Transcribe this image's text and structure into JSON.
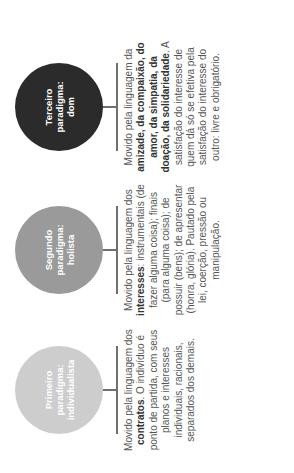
{
  "diagram": {
    "colors": {
      "first": "#cdcdcd",
      "second": "#9a9a9a",
      "third": "#2b2b2b",
      "connector": "#6f6f6f",
      "text": "#555555"
    },
    "paradigms": [
      {
        "title": "Primeiro paradigma: individualista",
        "text_before": "Movido pela linguagem dos ",
        "bold": "contratos",
        "text_after": ". O indivíduo é ponto de partida, com seus planos e interesses individuais, racionais, separados dos demais."
      },
      {
        "title": "Segundo paradigma: holista",
        "text_before": "Movido pela linguagem dos ",
        "bold": "interesses",
        "text_after": ": instrumentais (de fazer alguma coisa); finais (para alguma coisa); de possuir (bens); de apresentar (honra, glória). Pautado pela lei, coerção, pressão ou manipulação."
      },
      {
        "title": "Terceiro paradigma: dom",
        "text_before": "Movido pela linguagem da ",
        "bold": "amizade, da compaixão, do amor, da simpatia, da doação, da solidariedade",
        "text_after": ". A satisfação do interesse de quem dá só se efetiva pela satisfação do interesse do outro: livre e obrigatório."
      }
    ]
  }
}
